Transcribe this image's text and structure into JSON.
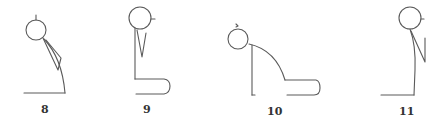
{
  "diagram": {
    "type": "posture-sequence",
    "figures": [
      {
        "id": "fig-8",
        "label": "8",
        "pose": "seated, head bowed forward, arm hanging"
      },
      {
        "id": "fig-9",
        "label": "9",
        "pose": "seated upright, legs extended forward"
      },
      {
        "id": "fig-10",
        "label": "10",
        "pose": "seated, torso folded forward over legs"
      },
      {
        "id": "fig-11",
        "label": "11",
        "pose": "seated upright, arm bent"
      }
    ],
    "colors": {
      "line": "#5a5a5a",
      "label": "#333333",
      "background": "#ffffff"
    }
  }
}
